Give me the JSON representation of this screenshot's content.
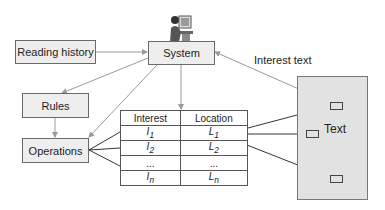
{
  "nodes": {
    "reading_history": "Reading history",
    "system": "System",
    "rules": "Rules",
    "operations": "Operations"
  },
  "edge_labels": {
    "interest_text": "Interest text"
  },
  "table": {
    "headers": [
      "Interest",
      "Location"
    ],
    "rows": [
      {
        "interest": "I",
        "interest_sub": "1",
        "location": "L",
        "location_sub": "1"
      },
      {
        "interest": "I",
        "interest_sub": "2",
        "location": "L",
        "location_sub": "2"
      },
      {
        "interest": "...",
        "interest_sub": "",
        "location": "...",
        "location_sub": ""
      },
      {
        "interest": "I",
        "interest_sub": "n",
        "location": "L",
        "location_sub": "n"
      }
    ]
  },
  "text_panel": {
    "label": "Text"
  },
  "icons": {
    "user": "person-at-computer-icon"
  },
  "colors": {
    "box_fill": "#eeeeee",
    "panel_fill": "#e2e2e2",
    "arrow_light": "#999999",
    "line_dark": "#333333"
  }
}
